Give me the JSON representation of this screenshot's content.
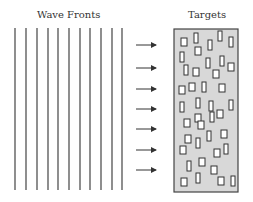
{
  "labels": {
    "left": "Wave Fronts",
    "right": "Targets"
  },
  "wavefronts": {
    "count": 11,
    "x": [
      15,
      26,
      37,
      48,
      58,
      69,
      80,
      90,
      101,
      112,
      122
    ],
    "y1": 28,
    "y2": 190,
    "color": "#444444"
  },
  "arrows": {
    "y": [
      45,
      68,
      89,
      109,
      129,
      150,
      170
    ],
    "x1": 136,
    "x2": 156,
    "color": "#333333"
  },
  "target_box": {
    "x": 174,
    "y": 29,
    "w": 64,
    "h": 163,
    "fill": "#d8d8d8",
    "stroke": "#444444"
  },
  "targets": [
    [
      181,
      38,
      6,
      8
    ],
    [
      194,
      33,
      4,
      10
    ],
    [
      218,
      31,
      4,
      10
    ],
    [
      208,
      40,
      4,
      10
    ],
    [
      229,
      37,
      4,
      10
    ],
    [
      180,
      52,
      4,
      10
    ],
    [
      195,
      47,
      6,
      8
    ],
    [
      220,
      56,
      4,
      10
    ],
    [
      228,
      63,
      6,
      8
    ],
    [
      206,
      58,
      4,
      10
    ],
    [
      184,
      65,
      4,
      10
    ],
    [
      193,
      68,
      6,
      8
    ],
    [
      213,
      70,
      6,
      8
    ],
    [
      179,
      86,
      6,
      8
    ],
    [
      189,
      83,
      6,
      8
    ],
    [
      202,
      82,
      4,
      10
    ],
    [
      219,
      84,
      6,
      8
    ],
    [
      234,
      81,
      6,
      8
    ],
    [
      180,
      102,
      4,
      10
    ],
    [
      196,
      98,
      4,
      10
    ],
    [
      209,
      101,
      4,
      10
    ],
    [
      229,
      100,
      4,
      10
    ],
    [
      195,
      114,
      6,
      8
    ],
    [
      217,
      110,
      6,
      8
    ],
    [
      210,
      112,
      4,
      10
    ],
    [
      184,
      119,
      6,
      8
    ],
    [
      198,
      121,
      6,
      8
    ],
    [
      238,
      119,
      4,
      10
    ],
    [
      185,
      135,
      6,
      8
    ],
    [
      207,
      131,
      4,
      10
    ],
    [
      221,
      130,
      6,
      8
    ],
    [
      196,
      138,
      4,
      10
    ],
    [
      232,
      140,
      6,
      8
    ],
    [
      180,
      146,
      6,
      8
    ],
    [
      214,
      149,
      6,
      8
    ],
    [
      224,
      144,
      4,
      10
    ],
    [
      187,
      161,
      4,
      10
    ],
    [
      199,
      158,
      6,
      8
    ],
    [
      211,
      166,
      6,
      8
    ],
    [
      232,
      158,
      6,
      8
    ],
    [
      181,
      178,
      6,
      8
    ],
    [
      196,
      173,
      4,
      10
    ],
    [
      218,
      177,
      6,
      8
    ],
    [
      231,
      176,
      4,
      10
    ]
  ]
}
